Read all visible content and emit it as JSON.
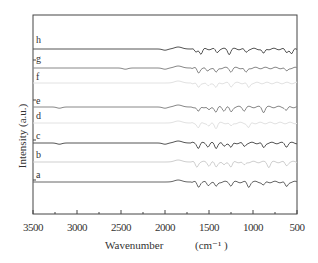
{
  "chart_data": {
    "type": "line",
    "title": "",
    "xlabel": "Wavenumber",
    "xlabel_unit": "(cm⁻¹ )",
    "ylabel": "Intensity (a.u.)",
    "xlim": [
      3500,
      500
    ],
    "x_reversed": true,
    "x_ticks": [
      3500,
      3000,
      2500,
      2000,
      1500,
      1000,
      500
    ],
    "grid": false,
    "legend": "inline trace labels at left",
    "series": [
      {
        "name": "h",
        "color": "#555555",
        "baseline_px": 49,
        "features_cm-1": [
          2000,
          1650,
          1590,
          1410,
          1270,
          1080,
          880,
          620,
          560
        ]
      },
      {
        "name": "g",
        "color": "#888888",
        "baseline_px": 68,
        "features_cm-1": [
          2450,
          2000,
          1620,
          1520,
          1420,
          1250,
          1080,
          620
        ]
      },
      {
        "name": "f",
        "color": "#e2e2e2",
        "baseline_px": 83,
        "features_cm-1": [
          1620,
          1510,
          1420,
          1250,
          1050
        ]
      },
      {
        "name": "e",
        "color": "#888888",
        "baseline_px": 107,
        "features_cm-1": [
          3200,
          2000,
          1620,
          1500,
          1420,
          1330,
          1250,
          1100,
          880,
          620
        ]
      },
      {
        "name": "d",
        "color": "#e2e2e2",
        "baseline_px": 123,
        "features_cm-1": [
          1620,
          1500,
          1420,
          1250,
          1050
        ]
      },
      {
        "name": "c",
        "color": "#555555",
        "baseline_px": 143,
        "features_cm-1": [
          3200,
          2000,
          1620,
          1510,
          1420,
          1330,
          1250,
          1100,
          880,
          620
        ]
      },
      {
        "name": "b",
        "color": "#cfcfcf",
        "baseline_px": 162,
        "features_cm-1": [
          1640,
          1500,
          1420,
          1330,
          1250,
          1100,
          820,
          620
        ]
      },
      {
        "name": "a",
        "color": "#666666",
        "baseline_px": 182,
        "features_cm-1": [
          1620,
          1510,
          1420,
          1250,
          1050,
          880,
          620
        ]
      }
    ]
  },
  "labels": {
    "x_ticks": [
      "3500",
      "3000",
      "2500",
      "2000",
      "1500",
      "1000",
      "500"
    ],
    "xlabel": "Wavenumber",
    "xunit": "(cm⁻¹ )",
    "ylabel": "Intensity (a.u.)",
    "traces": [
      "h",
      "g",
      "f",
      "e",
      "d",
      "c",
      "b",
      "a"
    ]
  }
}
